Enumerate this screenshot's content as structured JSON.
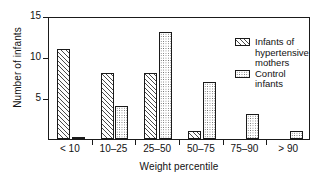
{
  "chart_data": {
    "type": "bar",
    "title": "",
    "xlabel": "Weight percentile",
    "ylabel": "Number of infants",
    "categories": [
      "< 10",
      "10–25",
      "25–50",
      "50–75",
      "75–90",
      "> 90"
    ],
    "series": [
      {
        "name": "Infants of\nhypertensive\nmothers",
        "values": [
          11,
          8,
          8,
          1,
          0,
          0
        ]
      },
      {
        "name": "Control infants",
        "values": [
          0.2,
          4,
          13,
          7,
          3,
          1
        ]
      }
    ],
    "ylim": [
      0,
      15
    ],
    "yticks": [
      5,
      10,
      15
    ],
    "ytick_labels": [
      "5",
      "10",
      "15"
    ],
    "grid": false,
    "legend_position": "top-right"
  },
  "legend": {
    "entries": [
      {
        "label": "Infants of\nhypertensive\nmothers",
        "pattern": "diagonal-hatch"
      },
      {
        "label": "Control infants",
        "pattern": "dotted-fill"
      }
    ]
  },
  "colors": {
    "axis": "#1a1a1a",
    "hatch": "#4a4a4a",
    "dots": "#555555",
    "background": "#ffffff"
  }
}
